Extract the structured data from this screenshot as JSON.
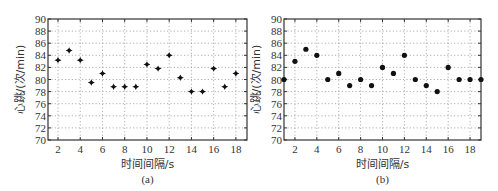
{
  "chart_data": [
    {
      "id": "a",
      "type": "scatter",
      "caption": "(a)",
      "title": "",
      "xlabel": "时间间隔/s",
      "ylabel": "心跳/(次/min)",
      "xlim": [
        1.1,
        19
      ],
      "ylim": [
        70,
        90
      ],
      "x_ticks": [
        2,
        4,
        6,
        8,
        10,
        12,
        14,
        16,
        18
      ],
      "y_ticks": [
        70,
        72,
        74,
        76,
        78,
        80,
        82,
        84,
        86,
        88,
        90
      ],
      "grid": true,
      "marker": "star-diamond",
      "series": [
        {
          "name": "heart_rate",
          "x": [
            2,
            3,
            4,
            5,
            6,
            7,
            8,
            9,
            10,
            11,
            12,
            13,
            14,
            15,
            16,
            17,
            18
          ],
          "y": [
            83.2,
            84.8,
            83.2,
            79.5,
            81.0,
            78.8,
            78.8,
            78.8,
            82.5,
            81.8,
            84.0,
            80.3,
            78.0,
            78.0,
            81.8,
            78.8,
            81.0
          ]
        }
      ]
    },
    {
      "id": "b",
      "type": "scatter",
      "caption": "(b)",
      "title": "",
      "xlabel": "时间间隔/s",
      "ylabel": "心跳/(次/min)",
      "xlim": [
        1,
        19
      ],
      "ylim": [
        70,
        90
      ],
      "x_ticks": [
        2,
        4,
        6,
        8,
        10,
        12,
        14,
        16,
        18
      ],
      "y_ticks": [
        70,
        72,
        74,
        76,
        78,
        80,
        82,
        84,
        86,
        88,
        90
      ],
      "grid": true,
      "marker": "dot",
      "series": [
        {
          "name": "heart_rate",
          "x": [
            1,
            2,
            3,
            4,
            5,
            6,
            7,
            8,
            9,
            10,
            11,
            12,
            13,
            14,
            15,
            16,
            17,
            18,
            19
          ],
          "y": [
            80,
            83,
            85,
            84,
            80,
            81,
            79,
            80,
            79,
            82,
            81,
            84,
            80,
            79,
            78,
            82,
            80,
            80,
            80
          ]
        }
      ]
    }
  ]
}
